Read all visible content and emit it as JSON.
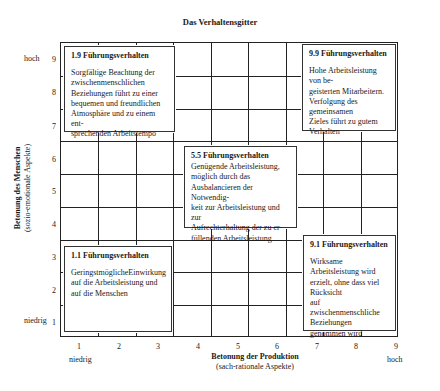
{
  "title": "Das Verhaltensgitter",
  "axes": {
    "y": {
      "label": "Betonung des Menschen",
      "sublabel": "(sozio-emotionale Aspekte)",
      "low": "niedrig",
      "high": "hoch",
      "ticks": [
        "1",
        "2",
        "3",
        "4",
        "5",
        "6",
        "7",
        "8",
        "9"
      ]
    },
    "x": {
      "label": "Betonung der Produktion",
      "sublabel": "(sach-rationale Aspekte)",
      "low": "niedrig",
      "high": "hoch",
      "ticks": [
        "1",
        "2",
        "3",
        "4",
        "5",
        "6",
        "7",
        "8",
        "9"
      ]
    }
  },
  "boxes": {
    "b19": {
      "heading": "1.9 Führungsverhalten",
      "text": "Sorgfältige Beachtung der\nzwischenmenschlichen\nBeziehungen führt zu einer\nbequemen und freundlichen\nAtmosphäre und zu einem ent-\nsprechenden Arbeitstempo"
    },
    "b99": {
      "heading": "9.9 Führungsverhalten",
      "text": "Hohe Arbeitsleistung von be-\ngeisterten Mitarbeitern.\nVerfolgung des gemeinsamen\nZieles führt zu gutem Verhalten"
    },
    "b55": {
      "heading": "5.5 Führungsverhalten",
      "text": "Genügende Arbeitsleistung,\nmöglich durch das\nAusbalancieren der Notwendig-\nkeit zur Arbeitsleistung und zur\nAufrechterhaltung der zu er-\nfüllenden Arbeitsleistung"
    },
    "b11": {
      "heading": "1.1 Führungsverhalten",
      "text": "GeringstmöglicheEinwirkung\nauf die Arbeitsleistung und\nauf die Menschen"
    },
    "b91": {
      "heading": "9.1 Führungsverhalten",
      "text": "Wirksame Arbeitsleistung wird\nerzielt, ohne dass viel\nRücksicht\nauf zwischenmenschliche\nBeziehungen genommen wird"
    }
  }
}
